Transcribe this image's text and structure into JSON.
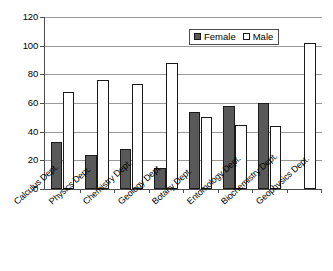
{
  "chart_data": {
    "type": "bar",
    "title": "",
    "xlabel": "",
    "ylabel": "",
    "ylim": [
      0,
      120
    ],
    "yticks": [
      0,
      20,
      40,
      60,
      80,
      100,
      120
    ],
    "grid": true,
    "legend_position": "top-right",
    "categories": [
      "Calculus Dept.",
      "Physics Dept.",
      "Chemistry Dept.",
      "Geology Dept.",
      "Botany Dept.",
      "Entomology Dept.",
      "Biochemistry Dept.",
      "Geophysics Dept."
    ],
    "series": [
      {
        "name": "Female",
        "color": "#595959",
        "values": [
          33,
          24,
          28,
          15,
          54,
          58,
          60,
          0
        ]
      },
      {
        "name": "Male",
        "color": "#ffffff",
        "values": [
          68,
          76,
          73,
          88,
          50,
          45,
          44,
          102
        ]
      }
    ]
  },
  "legend": {
    "items": [
      {
        "label": "Female",
        "swatch": "filled-dark-square"
      },
      {
        "label": "Male",
        "swatch": "outline-white-square"
      }
    ]
  }
}
